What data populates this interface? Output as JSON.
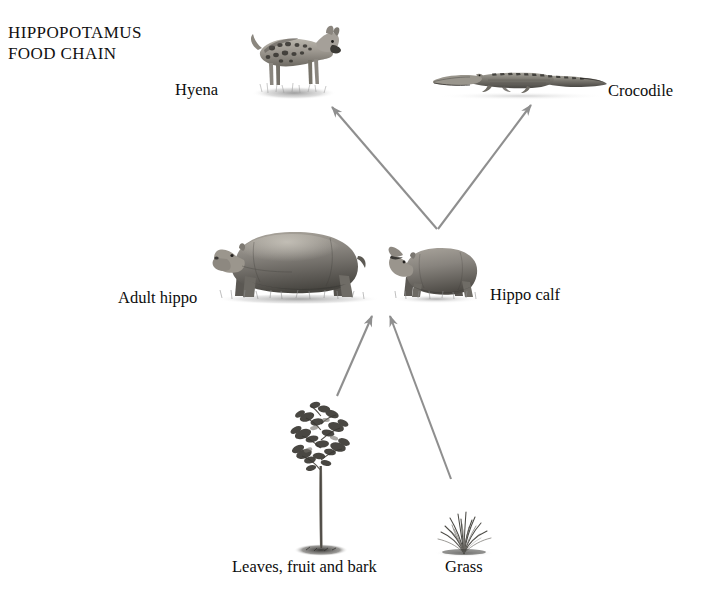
{
  "diagram": {
    "title": "HIPPOPOTAMUS\nFOOD CHAIN",
    "title_lines": [
      "HIPPOPOTAMUS",
      "FOOD CHAIN"
    ],
    "background_color": "#ffffff",
    "text_color": "#111111",
    "arrow_color": "#8f8f8f",
    "type": "food-chain",
    "nodes": [
      {
        "id": "hyena",
        "label": "Hyena",
        "role": "predator",
        "illustration": "hyena-illustration"
      },
      {
        "id": "crocodile",
        "label": "Crocodile",
        "role": "predator",
        "illustration": "crocodile-illustration"
      },
      {
        "id": "adult",
        "label": "Adult hippo",
        "role": "consumer",
        "illustration": "adult-hippo-illustration"
      },
      {
        "id": "calf",
        "label": "Hippo calf",
        "role": "consumer",
        "illustration": "hippo-calf-illustration"
      },
      {
        "id": "leaves",
        "label": "Leaves, fruit and bark",
        "role": "producer",
        "illustration": "tree-illustration"
      },
      {
        "id": "grass",
        "label": "Grass",
        "role": "producer",
        "illustration": "grass-illustration"
      }
    ],
    "edges": [
      {
        "from": "calf",
        "to": "hyena",
        "direction": "up-left"
      },
      {
        "from": "calf",
        "to": "crocodile",
        "direction": "up-right"
      },
      {
        "from": "leaves",
        "to": "adult",
        "direction": "up-right"
      },
      {
        "from": "grass",
        "to": "calf",
        "direction": "up-left"
      }
    ]
  }
}
